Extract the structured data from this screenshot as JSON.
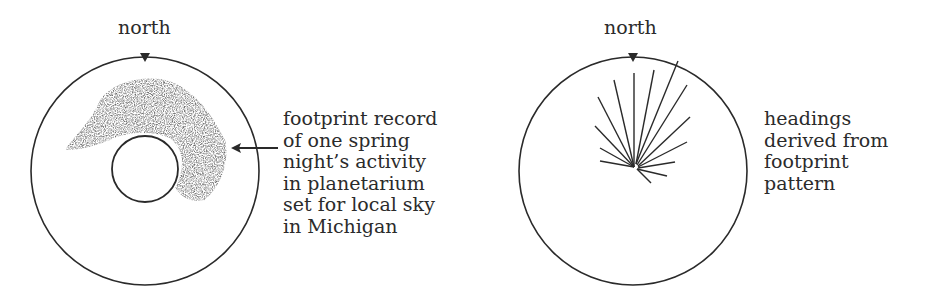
{
  "left_panel": {
    "north_label": "north",
    "caption_lines": [
      "footprint record",
      "of one spring",
      "night’s activity",
      "in planetarium",
      "set for local sky",
      "in Michigan"
    ]
  },
  "right_panel": {
    "north_label": "north",
    "caption_lines": [
      "headings",
      "derived from",
      "footprint",
      "pattern"
    ]
  },
  "colors": {
    "ink": "#2a2a2a",
    "background": "#ffffff"
  }
}
